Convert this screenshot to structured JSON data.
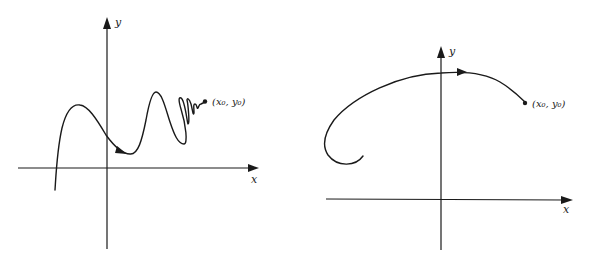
{
  "figure": {
    "colors": {
      "ink": "#1a1a1a",
      "background": "#ffffff"
    },
    "panels": [
      {
        "id": "left",
        "description": "Curve that oscillates with increasing frequency as it approaches the point",
        "axes": {
          "x_label": "x",
          "y_label": "y"
        },
        "point_label": "(x₀, y₀)",
        "curve_direction": "toward point",
        "features": [
          "rising from below x-axis",
          "local max",
          "direction arrow",
          "local min",
          "tall peak",
          "rapid oscillations near point"
        ]
      },
      {
        "id": "right",
        "description": "Smooth curve arcing over the y-axis ending at the point, starting from a hook on the left",
        "axes": {
          "x_label": "x",
          "y_label": "y"
        },
        "point_label": "(x₀, y₀)",
        "curve_direction": "toward point",
        "features": [
          "hook start at left",
          "arc over y-axis",
          "direction arrow near top",
          "endpoint dot"
        ]
      }
    ]
  }
}
